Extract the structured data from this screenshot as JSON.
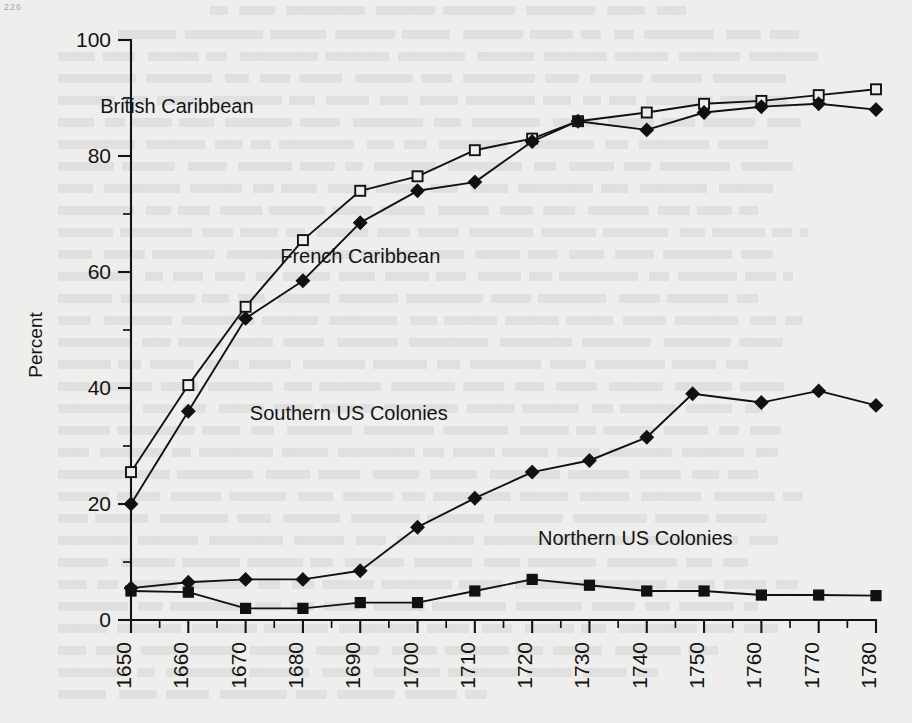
{
  "page": {
    "corner_mark": "226",
    "background_color": "#eeeeec",
    "ink_color": "#111111"
  },
  "chart_data": {
    "type": "line",
    "title": "",
    "xlabel": "",
    "ylabel": "Percent",
    "xlim": [
      1650,
      1780
    ],
    "ylim": [
      0,
      100
    ],
    "x_major_ticks": [
      1650,
      1660,
      1670,
      1680,
      1690,
      1700,
      1710,
      1720,
      1730,
      1740,
      1750,
      1760,
      1770,
      1780
    ],
    "x_minor_step": 5,
    "y_major_ticks": [
      0,
      20,
      40,
      60,
      80,
      100
    ],
    "y_minor_step": 10,
    "x_tick_labels": [
      "1650",
      "1660",
      "1670",
      "1680",
      "1690",
      "1700",
      "1710",
      "1720",
      "1730",
      "1740",
      "1750",
      "1760",
      "1770",
      "1780"
    ],
    "y_tick_labels": [
      "0",
      "20",
      "40",
      "60",
      "80",
      "100"
    ],
    "grid": false,
    "legend": "inline-labels",
    "x": [
      1650,
      1660,
      1670,
      1680,
      1690,
      1700,
      1710,
      1720,
      1730,
      1740,
      1750,
      1760,
      1770,
      1780
    ],
    "series": [
      {
        "name": "British Caribbean",
        "marker": "open-square",
        "x": [
          1650,
          1660,
          1670,
          1680,
          1690,
          1700,
          1710,
          1720,
          1728,
          1740,
          1750,
          1760,
          1770,
          1780
        ],
        "values": [
          25.5,
          40.5,
          54.0,
          65.5,
          74.0,
          76.5,
          81.0,
          83.0,
          86.0,
          87.5,
          89.0,
          89.5,
          90.5,
          91.5
        ]
      },
      {
        "name": "French Caribbean",
        "marker": "filled-diamond",
        "x": [
          1650,
          1660,
          1670,
          1680,
          1690,
          1700,
          1710,
          1720,
          1728,
          1740,
          1750,
          1760,
          1770,
          1780
        ],
        "values": [
          20.0,
          36.0,
          52.0,
          58.5,
          68.5,
          74.0,
          75.5,
          82.5,
          86.0,
          84.5,
          87.5,
          88.5,
          89.0,
          88.0
        ]
      },
      {
        "name": "Southern US Colonies",
        "marker": "filled-diamond",
        "x": [
          1650,
          1660,
          1670,
          1680,
          1690,
          1700,
          1710,
          1720,
          1730,
          1740,
          1748,
          1760,
          1770,
          1780
        ],
        "values": [
          5.5,
          6.5,
          7.0,
          7.0,
          8.5,
          16.0,
          21.0,
          25.5,
          27.5,
          31.5,
          39.0,
          37.5,
          39.5,
          37.0
        ]
      },
      {
        "name": "Northern US Colonies",
        "marker": "filled-square",
        "x": [
          1650,
          1660,
          1670,
          1680,
          1690,
          1700,
          1710,
          1720,
          1730,
          1740,
          1750,
          1760,
          1770,
          1780
        ],
        "values": [
          5.0,
          4.8,
          2.0,
          2.0,
          3.0,
          3.0,
          5.0,
          7.0,
          6.0,
          5.0,
          5.0,
          4.3,
          4.3,
          4.2
        ]
      }
    ],
    "series_label_positions": [
      {
        "name": "British Caribbean",
        "x": 1658,
        "y": 87.5
      },
      {
        "name": "French Caribbean",
        "x": 1690,
        "y": 61.5
      },
      {
        "name": "Southern US Colonies",
        "x": 1688,
        "y": 34.5
      },
      {
        "name": "Northern US Colonies",
        "x": 1738,
        "y": 13.0
      }
    ]
  }
}
